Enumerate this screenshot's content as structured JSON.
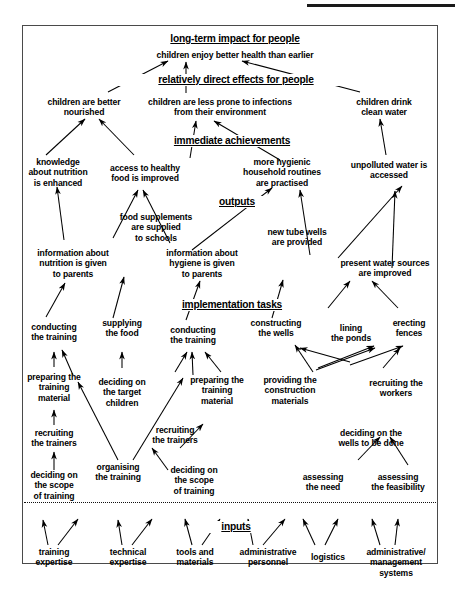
{
  "diagram": {
    "title_rule": true,
    "levels": [
      {
        "id": "long-term-impact",
        "label": "long-term impact for people"
      },
      {
        "id": "relatively-direct-effects",
        "label": "relatively direct effects for people"
      },
      {
        "id": "immediate-achievements",
        "label": "immediate achievements"
      },
      {
        "id": "outputs",
        "label": "outputs"
      },
      {
        "id": "implementation-tasks",
        "label": "implementation tasks"
      },
      {
        "id": "inputs",
        "label": "inputs"
      }
    ],
    "nodes": {
      "impact_1": "children enjoy better health than earlier",
      "effect_1": "children are better\nnourished",
      "effect_2": "children are less prone to infections\nfrom their environment",
      "effect_3": "children drink\nclean water",
      "achieve_1": "knowledge\nabout nutrition\nis enhanced",
      "achieve_2": "access to healthy\nfood is improved",
      "achieve_3": "more hygienic\nhousehold routines\nare practised",
      "achieve_4": "unpolluted water is\naccessed",
      "output_1": "information about\nnutrition is given\nto parents",
      "output_2": "food supplements\nare supplied\nto schools",
      "output_3": "information about\nhygiene is given\nto parents",
      "output_4": "new tube wells\nare provided",
      "output_5": "present water sources\nare improved",
      "task_1": "conducting\nthe training",
      "task_2": "supplying\nthe food",
      "task_3": "conducting\nthe training",
      "task_4": "constructing\nthe wells",
      "task_5": "lining\nthe ponds",
      "task_6": "erecting\nfences",
      "task_7": "preparing the\ntraining\nmaterial",
      "task_8": "deciding on\nthe target\nchildren",
      "task_9": "preparing the\ntraining\nmaterial",
      "task_10": "providing the\nconstruction\nmaterials",
      "task_11": "recruiting the\nworkers",
      "task_12": "recruiting\nthe trainers",
      "task_13": "recruiting\nthe trainers",
      "task_14": "deciding on the\nwells to be done",
      "task_15": "organising\nthe training",
      "task_16": "deciding on\nthe scope\nof training",
      "task_17": "deciding on\nthe scope\nof training",
      "task_18": "assessing\nthe need",
      "task_19": "assessing\nthe feasibility",
      "input_1": "training\nexpertise",
      "input_2": "technical\nexpertise",
      "input_3": "tools and\nmaterials",
      "input_4": "administrative\npersonnel",
      "input_5": "logistics",
      "input_6": "administrative/\nmanagement\nsystems"
    },
    "colors": {
      "ink": "#000000",
      "frame": "#4a4a4a",
      "rule": "#1a1a1a"
    }
  }
}
